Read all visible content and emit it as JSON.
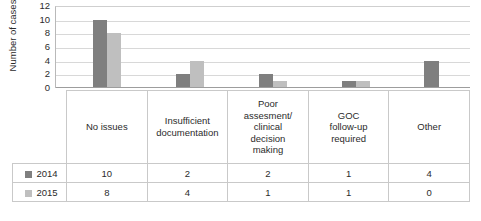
{
  "chart_data": {
    "type": "bar",
    "title": "",
    "xlabel": "",
    "ylabel": "Number of cases",
    "ylim": [
      0,
      12
    ],
    "ytick_values": [
      12,
      10,
      8,
      6,
      4,
      2,
      0
    ],
    "grid": true,
    "legend_position": "data-table-row-keys",
    "categories": [
      "No issues",
      "Insufficient documentation",
      "Poor assesment/ clinical decision making",
      "GOC follow-up required",
      "Other"
    ],
    "category_lines": [
      [
        "No issues"
      ],
      [
        "Insufficient",
        "documentation"
      ],
      [
        "Poor",
        "assesment/",
        "clinical",
        "decision",
        "making"
      ],
      [
        "GOC",
        "follow-up",
        "required"
      ],
      [
        "Other"
      ]
    ],
    "series": [
      {
        "name": "2014",
        "color": "#7f7f7f",
        "values": [
          10,
          2,
          2,
          1,
          4
        ]
      },
      {
        "name": "2015",
        "color": "#bfbfbf",
        "values": [
          8,
          4,
          1,
          1,
          0
        ]
      }
    ]
  },
  "data_table": {
    "row_labels": [
      "2014",
      "2015"
    ],
    "rows": [
      [
        "10",
        "2",
        "2",
        "1",
        "4"
      ],
      [
        "8",
        "4",
        "1",
        "1",
        "0"
      ]
    ]
  },
  "icons": {
    "legend_key_2014": "legend-swatch-dark",
    "legend_key_2015": "legend-swatch-light"
  }
}
